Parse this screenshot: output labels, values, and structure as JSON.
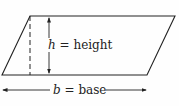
{
  "diagram": {
    "shape": "parallelogram",
    "height_label": {
      "variable": "h",
      "equals": " = ",
      "text": "height"
    },
    "base_label": {
      "variable": "b",
      "equals": " = ",
      "text": "base"
    },
    "colors": {
      "stroke": "#222222",
      "background": "#fefefe"
    }
  }
}
